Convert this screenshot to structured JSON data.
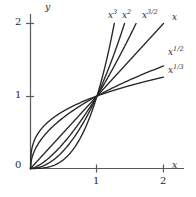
{
  "chart_data": {
    "type": "line",
    "title": "",
    "subtitle": "",
    "xlabel": "x",
    "ylabel": "y",
    "xlim": [
      0,
      2.25
    ],
    "ylim": [
      0,
      2.25
    ],
    "xticks": [
      1,
      2
    ],
    "yticks": [
      1,
      2
    ],
    "xtick_labels": [
      "1",
      "2"
    ],
    "ytick_labels": [
      "1",
      "2"
    ],
    "origin_label": "0",
    "grid": false,
    "legend": "inline-end-labels",
    "annotations": [
      "All curves pass through (0,0) and (1,1)",
      "Curves clipped at y = 2"
    ],
    "series": [
      {
        "name": "x^3",
        "label_base": "x",
        "label_exponent": "3",
        "exponent": 3,
        "x": [
          0,
          0.1,
          0.2,
          0.3,
          0.4,
          0.5,
          0.6,
          0.7,
          0.8,
          0.9,
          1.0,
          1.1,
          1.2,
          1.26
        ],
        "y": [
          0,
          0.001,
          0.008,
          0.027,
          0.064,
          0.125,
          0.216,
          0.343,
          0.512,
          0.729,
          1.0,
          1.331,
          1.728,
          2.0
        ]
      },
      {
        "name": "x^2",
        "label_base": "x",
        "label_exponent": "2",
        "exponent": 2,
        "x": [
          0,
          0.1,
          0.2,
          0.3,
          0.4,
          0.5,
          0.6,
          0.7,
          0.8,
          0.9,
          1.0,
          1.1,
          1.2,
          1.3,
          1.414
        ],
        "y": [
          0,
          0.01,
          0.04,
          0.09,
          0.16,
          0.25,
          0.36,
          0.49,
          0.64,
          0.81,
          1.0,
          1.21,
          1.44,
          1.69,
          2.0
        ]
      },
      {
        "name": "x^(3/2)",
        "label_base": "x",
        "label_exponent": "3/2",
        "exponent": 1.5,
        "x": [
          0,
          0.1,
          0.2,
          0.3,
          0.4,
          0.5,
          0.6,
          0.7,
          0.8,
          0.9,
          1.0,
          1.2,
          1.4,
          1.5874
        ],
        "y": [
          0,
          0.0316,
          0.0894,
          0.1643,
          0.253,
          0.3536,
          0.4648,
          0.5857,
          0.7155,
          0.8538,
          1.0,
          1.3145,
          1.6565,
          2.0
        ]
      },
      {
        "name": "x",
        "label_base": "x",
        "label_exponent": "",
        "exponent": 1,
        "x": [
          0,
          0.25,
          0.5,
          0.75,
          1.0,
          1.25,
          1.5,
          1.75,
          2.0
        ],
        "y": [
          0,
          0.25,
          0.5,
          0.75,
          1.0,
          1.25,
          1.5,
          1.75,
          2.0
        ]
      },
      {
        "name": "x^(1/2)",
        "label_base": "x",
        "label_exponent": "1/2",
        "exponent": 0.5,
        "x": [
          0,
          0.05,
          0.1,
          0.2,
          0.3,
          0.4,
          0.5,
          0.6,
          0.7,
          0.8,
          0.9,
          1.0,
          1.25,
          1.5,
          1.75,
          2.0
        ],
        "y": [
          0,
          0.2236,
          0.3162,
          0.4472,
          0.5477,
          0.6325,
          0.7071,
          0.7746,
          0.8367,
          0.8944,
          0.9487,
          1.0,
          1.118,
          1.2247,
          1.3229,
          1.4142
        ]
      },
      {
        "name": "x^(1/3)",
        "label_base": "x",
        "label_exponent": "1/3",
        "exponent": 0.3333,
        "x": [
          0,
          0.05,
          0.1,
          0.2,
          0.3,
          0.4,
          0.5,
          0.6,
          0.7,
          0.8,
          0.9,
          1.0,
          1.25,
          1.5,
          1.75,
          2.0
        ],
        "y": [
          0,
          0.3684,
          0.4642,
          0.5848,
          0.6694,
          0.7368,
          0.7937,
          0.8434,
          0.8879,
          0.9283,
          0.9655,
          1.0,
          1.0772,
          1.1447,
          1.2051,
          1.2599
        ]
      }
    ],
    "colors": {
      "curve": "#262626",
      "axis": "#555555",
      "text": "#2b2b2b",
      "background": "#ffffff"
    }
  },
  "labels": {
    "y_axis": "y",
    "x_axis": "x",
    "zero": "0",
    "y_tick_2": "2",
    "y_tick_1": "1",
    "x_tick_1": "1",
    "x_tick_2": "2",
    "curve_x3_base": "x",
    "curve_x3_exp": "3",
    "curve_x2_base": "x",
    "curve_x2_exp": "2",
    "curve_x32_base": "x",
    "curve_x32_exp": "3/2",
    "curve_x_base": "x",
    "curve_xhalf_base": "x",
    "curve_xhalf_exp": "1/2",
    "curve_xthird_base": "x",
    "curve_xthird_exp": "1/3"
  }
}
